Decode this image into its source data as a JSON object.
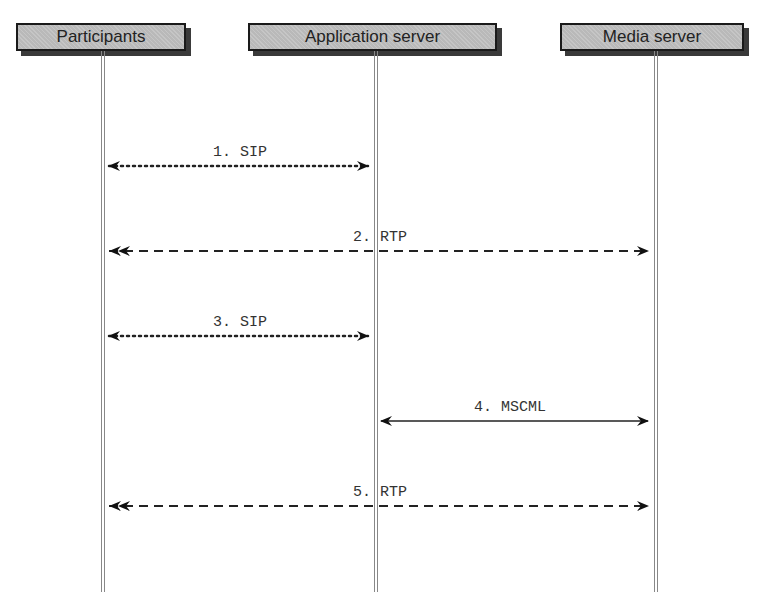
{
  "participants": [
    {
      "id": "participants",
      "label": "Participants",
      "box_left": 16,
      "box_width": 170,
      "x": 102
    },
    {
      "id": "app-server",
      "label": "Application server",
      "box_left": 248,
      "box_width": 249,
      "x": 375
    },
    {
      "id": "media-server",
      "label": "Media server",
      "box_left": 560,
      "box_width": 184,
      "x": 655
    }
  ],
  "messages": [
    {
      "label": "1. SIP",
      "from": "participants",
      "to": "app-server",
      "style": "dotted",
      "y": 166
    },
    {
      "label": "2. RTP",
      "from": "participants",
      "to": "media-server",
      "style": "dashed",
      "y": 251
    },
    {
      "label": "3. SIP",
      "from": "participants",
      "to": "app-server",
      "style": "dotted",
      "y": 336
    },
    {
      "label": "4. MSCML",
      "from": "app-server",
      "to": "media-server",
      "style": "solid",
      "y": 421
    },
    {
      "label": "5. RTP",
      "from": "participants",
      "to": "media-server",
      "style": "dashed",
      "y": 506
    }
  ]
}
